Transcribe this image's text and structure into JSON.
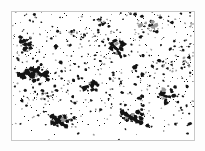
{
  "image": {
    "type": "binary-particle-micrograph",
    "width": 205,
    "height": 151,
    "outer_background_color": "#fdfdfd",
    "panel_background_color": "#ffffff",
    "particle_color": "#111111",
    "faint_particle_color": "#9a9a9a",
    "description": "Thresholded black-and-white speckle field of scattered dark particles inside a thin rectangular border"
  },
  "frame": {
    "x": 11,
    "y": 11,
    "width": 184,
    "height": 130,
    "border_width": 1,
    "border_color": "#c8c8c8"
  },
  "particle_field": {
    "region": {
      "x": 13,
      "y": 13,
      "width": 180,
      "height": 126
    },
    "random_seed": 20240517,
    "dot_count": 760,
    "dot_color": "#141414",
    "faint_fraction": 0.42,
    "density_bands": [
      {
        "y_start": 0.0,
        "y_end": 0.12,
        "weight": 0.82
      },
      {
        "y_start": 0.12,
        "y_end": 0.3,
        "weight": 1.15
      },
      {
        "y_start": 0.3,
        "y_end": 0.52,
        "weight": 1.25
      },
      {
        "y_start": 0.52,
        "y_end": 0.74,
        "weight": 1.1
      },
      {
        "y_start": 0.74,
        "y_end": 0.9,
        "weight": 0.85
      },
      {
        "y_start": 0.9,
        "y_end": 1.0,
        "weight": 0.1
      }
    ],
    "clusters": [
      {
        "cx": 34,
        "cy": 74,
        "rx": 15,
        "ry": 7,
        "count": 34,
        "heavy": true
      },
      {
        "cx": 132,
        "cy": 116,
        "rx": 12,
        "ry": 7,
        "count": 30,
        "heavy": true
      },
      {
        "cx": 60,
        "cy": 120,
        "rx": 11,
        "ry": 6,
        "count": 24,
        "heavy": true
      },
      {
        "cx": 150,
        "cy": 26,
        "rx": 10,
        "ry": 6,
        "count": 18,
        "heavy": true
      },
      {
        "cx": 118,
        "cy": 48,
        "rx": 8,
        "ry": 8,
        "count": 20,
        "heavy": true
      },
      {
        "cx": 166,
        "cy": 96,
        "rx": 11,
        "ry": 7,
        "count": 18,
        "heavy": true
      },
      {
        "cx": 25,
        "cy": 44,
        "rx": 7,
        "ry": 6,
        "count": 14,
        "heavy": true
      },
      {
        "cx": 92,
        "cy": 88,
        "rx": 9,
        "ry": 7,
        "count": 16,
        "heavy": true
      },
      {
        "cx": 78,
        "cy": 34,
        "rx": 9,
        "ry": 6,
        "count": 14,
        "heavy": false
      },
      {
        "cx": 186,
        "cy": 62,
        "rx": 6,
        "ry": 9,
        "count": 12,
        "heavy": false
      },
      {
        "cx": 104,
        "cy": 22,
        "rx": 8,
        "ry": 5,
        "count": 12,
        "heavy": false
      },
      {
        "cx": 48,
        "cy": 96,
        "rx": 9,
        "ry": 6,
        "count": 14,
        "heavy": false
      }
    ],
    "chains": [
      {
        "points": [
          [
            22,
            76
          ],
          [
            27,
            71
          ],
          [
            31,
            76
          ],
          [
            36,
            70
          ],
          [
            41,
            75
          ],
          [
            47,
            72
          ]
        ],
        "thickness": 3
      },
      {
        "points": [
          [
            122,
            112
          ],
          [
            127,
            115
          ],
          [
            132,
            118
          ],
          [
            137,
            121
          ],
          [
            141,
            123
          ]
        ],
        "thickness": 3
      },
      {
        "points": [
          [
            52,
            116
          ],
          [
            57,
            120
          ],
          [
            62,
            124
          ],
          [
            66,
            126
          ]
        ],
        "thickness": 3
      },
      {
        "points": [
          [
            112,
            44
          ],
          [
            116,
            48
          ],
          [
            119,
            53
          ],
          [
            121,
            57
          ]
        ],
        "thickness": 2
      },
      {
        "points": [
          [
            160,
            94
          ],
          [
            165,
            96
          ],
          [
            170,
            97
          ]
        ],
        "thickness": 2
      }
    ]
  }
}
